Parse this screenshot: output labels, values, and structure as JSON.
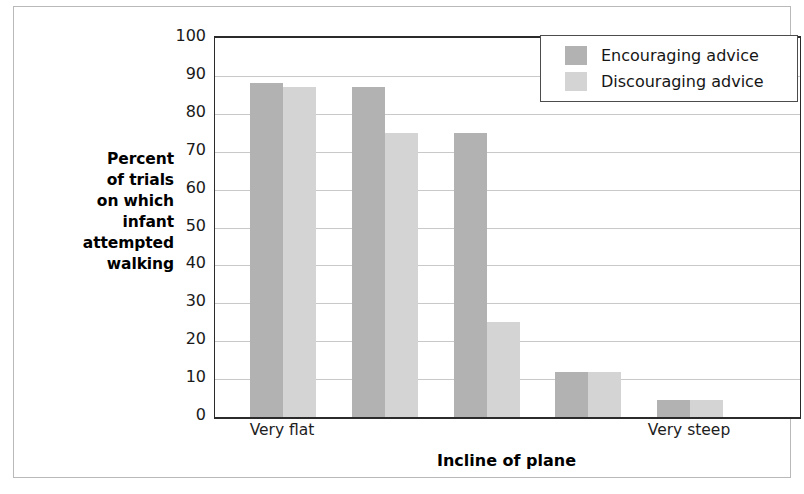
{
  "figure": {
    "y_axis_title_lines": [
      "Percent",
      "of trials",
      "on which",
      "infant",
      "attempted",
      "walking"
    ],
    "x_axis_title": "Incline of plane"
  },
  "legend": {
    "position": "top-right-inside-plot",
    "entries": [
      {
        "label": "Encouraging advice",
        "color": "#b2b2b2",
        "key": "enc"
      },
      {
        "label": "Discouraging advice",
        "color": "#d4d4d4",
        "key": "dis"
      }
    ]
  },
  "chart_data": {
    "type": "bar",
    "title": "",
    "subtitle": "",
    "xlabel": "Incline of plane",
    "ylabel": "Percent of trials on which infant attempted walking",
    "ylim": [
      0,
      100
    ],
    "yticks": [
      0,
      10,
      20,
      30,
      40,
      50,
      60,
      70,
      80,
      90,
      100
    ],
    "ytick_labels": [
      "0",
      "10",
      "20",
      "30",
      "40",
      "50",
      "60",
      "70",
      "80",
      "90",
      "100"
    ],
    "categories": [
      "Very flat",
      "",
      "",
      "",
      "Very steep"
    ],
    "category_tick_labels_shown": [
      "Very flat",
      "Very steep"
    ],
    "grid": "horizontal",
    "legend_position": "upper right",
    "series": [
      {
        "name": "Encouraging advice",
        "color": "#b2b2b2",
        "values": [
          88,
          87,
          75,
          12,
          4.5
        ]
      },
      {
        "name": "Discouraging advice",
        "color": "#d4d4d4",
        "values": [
          87,
          75,
          25,
          12,
          4.5
        ]
      }
    ]
  }
}
